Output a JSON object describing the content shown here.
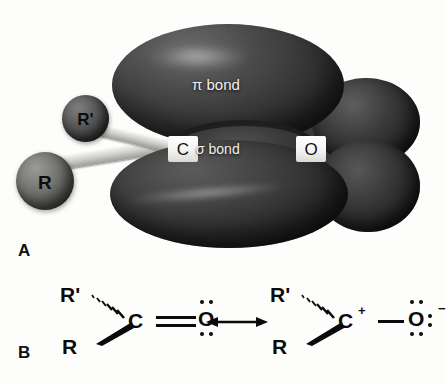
{
  "figure": {
    "type": "chemistry-illustration",
    "background_color": "#fdfdfb"
  },
  "panel_a": {
    "letter": "A",
    "caption": "Orbital model of the carbonyl group",
    "orbital_labels": {
      "pi": "π bond",
      "sigma": "σ bond"
    },
    "atoms": {
      "carbon": "C",
      "oxygen": "O"
    },
    "substituents": {
      "r_prime": "R'",
      "r": "R"
    },
    "colors": {
      "pi_lobe": "#333333",
      "sigma_lobe": "#3a3a3a",
      "lone_pair_lobe": "#2e2e2e",
      "bond_stick": "#cfcfcb",
      "sphere_r": "#767672",
      "sphere_r_prime": "#5a5a5a",
      "atom_patch": "#ffffff",
      "label_text": "#efefef"
    }
  },
  "panel_b": {
    "letter": "B",
    "caption": "Resonance structures of the carbonyl group",
    "arrow": "↔",
    "structures": [
      {
        "name": "neutral-carbonyl",
        "r_prime": "R'",
        "r": "R",
        "carbon": "C",
        "carbon_charge": "",
        "bond_order": "double",
        "oxygen": "O",
        "oxygen_charge": "",
        "oxygen_lone_pairs": 2,
        "lone_pair_positions": [
          "top",
          "bottom"
        ]
      },
      {
        "name": "charge-separated-carbonyl",
        "r_prime": "R'",
        "r": "R",
        "carbon": "C",
        "carbon_charge": "+",
        "bond_order": "single",
        "oxygen": "O",
        "oxygen_charge": "−",
        "oxygen_lone_pairs": 3,
        "lone_pair_positions": [
          "top",
          "bottom",
          "right"
        ]
      }
    ],
    "colors": {
      "ink": "#0a0a0a"
    }
  }
}
